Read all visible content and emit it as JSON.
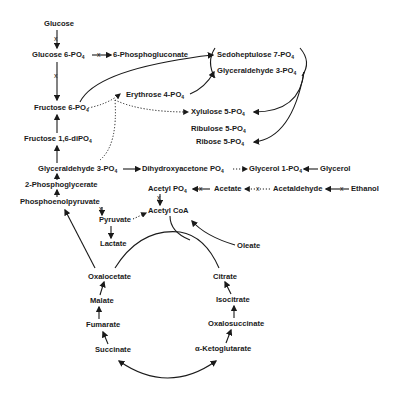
{
  "diagram": {
    "title": "",
    "nodes": {
      "glucose": "Glucose",
      "glucose6p": "Glucose 6-PO",
      "phosphogluconate": "6-Phosphogluconate",
      "sedoheptulose": "Sedoheptulose 7-PO",
      "glyceraldehyde3p_top": "Glyceraldehyde 3-PO",
      "fructose6p": "Fructose 6-PO",
      "erythrose": "Erythrose 4-PO",
      "xylulose": "Xylulose 5-PO",
      "ribulose": "Ribulose 5-PO",
      "ribose": "Ribose 5-PO",
      "fructose16": "Fructose 1,6-diPO",
      "glyceraldehyde3p": "Glyceraldehyde 3-PO",
      "dhap": "Dihydroxyacetone PO",
      "glycerol1p": "Glycerol 1-PO",
      "glycerol": "Glycerol",
      "pga2": "2-Phosphoglycerate",
      "acetylp": "Acetyl PO",
      "acetate": "Acetate",
      "acetaldehyde": "Acetaldehyde",
      "ethanol": "Ethanol",
      "pep": "Phosphoenolpyruvate",
      "acetylcoa": "Acetyl CoA",
      "pyruvate": "Pyruvate",
      "lactate": "Lactate",
      "oleate": "Oleate",
      "oxalocetate": "Oxalocetate",
      "citrate": "Citrate",
      "malate": "Malate",
      "isocitrate": "Isocitrate",
      "fumarate": "Fumarate",
      "oxalosuccinate": "Oxalosuccinate",
      "succinate": "Succinate",
      "ketoglutarate": "α-Ketoglutarate"
    },
    "subscript": "4",
    "blocked_marker": "x"
  }
}
